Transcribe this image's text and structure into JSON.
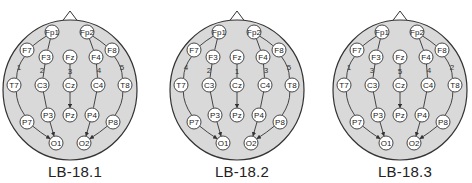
{
  "colors": {
    "head_fill": "#d9d9d9",
    "head_stroke": "#333333",
    "electrode_fill": "#ffffff",
    "electrode_stroke": "#333333",
    "line": "#333333"
  },
  "electrodes": [
    {
      "id": "Fp1",
      "x": -18,
      "y": 12
    },
    {
      "id": "Fp2",
      "x": 17,
      "y": 12
    },
    {
      "id": "F7",
      "x": -43,
      "y": 30
    },
    {
      "id": "F3",
      "x": -24,
      "y": 37
    },
    {
      "id": "Fz",
      "x": 0,
      "y": 37
    },
    {
      "id": "F4",
      "x": 26,
      "y": 37
    },
    {
      "id": "F8",
      "x": 42,
      "y": 30
    },
    {
      "id": "T7",
      "x": -56,
      "y": 65
    },
    {
      "id": "C3",
      "x": -28,
      "y": 65
    },
    {
      "id": "Cz",
      "x": 0,
      "y": 65
    },
    {
      "id": "C4",
      "x": 28,
      "y": 65
    },
    {
      "id": "T8",
      "x": 55,
      "y": 65
    },
    {
      "id": "P7",
      "x": -43,
      "y": 102
    },
    {
      "id": "P3",
      "x": -22,
      "y": 95
    },
    {
      "id": "Pz",
      "x": 0,
      "y": 95
    },
    {
      "id": "P4",
      "x": 22,
      "y": 95
    },
    {
      "id": "P8",
      "x": 43,
      "y": 102
    },
    {
      "id": "O1",
      "x": -14,
      "y": 123
    },
    {
      "id": "O2",
      "x": 14,
      "y": 123
    }
  ],
  "chains": [
    {
      "key": "left_temporal",
      "path": [
        "Fp1",
        "F7",
        "T7",
        "P7",
        "O1"
      ],
      "label_pos": {
        "x": -51,
        "y": 47
      }
    },
    {
      "key": "left_parasagittal",
      "path": [
        "Fp1",
        "F3",
        "C3",
        "P3",
        "O1"
      ],
      "label_pos": {
        "x": -28,
        "y": 50
      }
    },
    {
      "key": "midline",
      "path": [
        "Fz",
        "Cz",
        "Pz"
      ],
      "label_pos": {
        "x": 0,
        "y": 51
      }
    },
    {
      "key": "right_parasagittal",
      "path": [
        "Fp2",
        "F4",
        "C4",
        "P4",
        "O2"
      ],
      "label_pos": {
        "x": 29,
        "y": 50
      }
    },
    {
      "key": "right_temporal",
      "path": [
        "Fp2",
        "F8",
        "T8",
        "P8",
        "O2"
      ],
      "label_pos": {
        "x": 52,
        "y": 47
      }
    }
  ],
  "montages": [
    {
      "name": "LB-18.1",
      "left": 0,
      "order": {
        "left_temporal": "1",
        "left_parasagittal": "2",
        "midline": "3",
        "right_parasagittal": "4",
        "right_temporal": "5"
      }
    },
    {
      "name": "LB-18.2",
      "left": 167,
      "order": {
        "left_temporal": "4",
        "left_parasagittal": "2",
        "midline": "1",
        "right_parasagittal": "3",
        "right_temporal": "5"
      }
    },
    {
      "name": "LB-18.3",
      "left": 330,
      "order": {
        "left_temporal": "1",
        "left_parasagittal": "3",
        "midline": "5",
        "right_parasagittal": "4",
        "right_temporal": "2"
      }
    }
  ],
  "captions": {
    "m0": "LB-18.1",
    "m1": "LB-18.2",
    "m2": "LB-18.3"
  }
}
